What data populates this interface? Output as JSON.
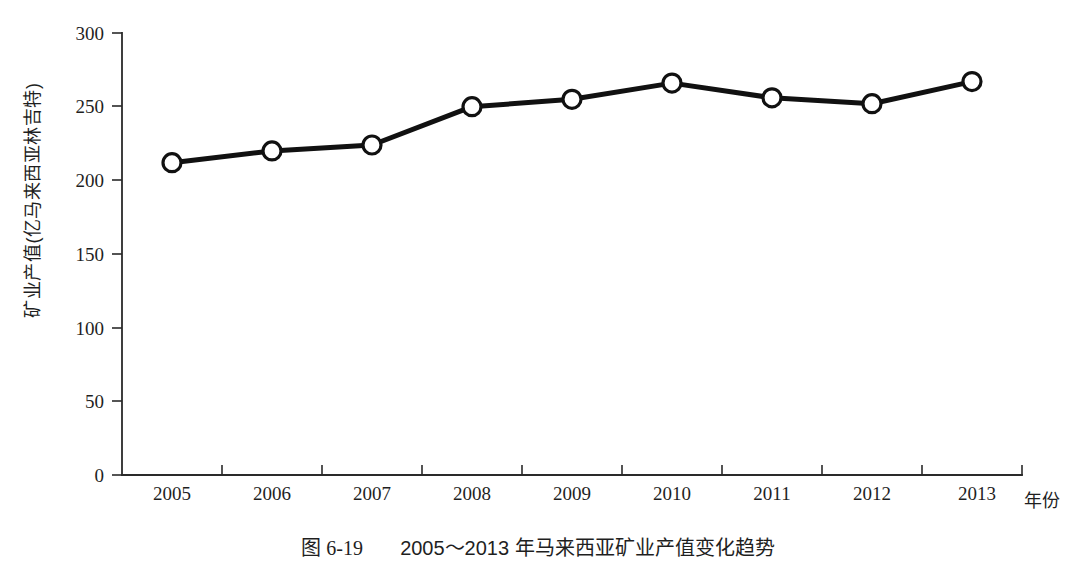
{
  "chart_data": {
    "type": "line",
    "title": "",
    "categories": [
      "2005",
      "2006",
      "2007",
      "2008",
      "2009",
      "2010",
      "2011",
      "2012",
      "2013"
    ],
    "values": [
      212,
      220,
      224,
      250,
      255,
      266,
      256,
      252,
      267
    ],
    "series": [
      {
        "name": "矿业产值",
        "values": [
          212,
          220,
          224,
          250,
          255,
          266,
          256,
          252,
          267
        ]
      }
    ],
    "xlabel": "年份",
    "ylabel": "矿业产值(亿马来西亚林吉特)",
    "ylim": [
      0,
      300
    ],
    "yticks": [
      "0",
      "50",
      "100",
      "150",
      "200",
      "250",
      "300"
    ],
    "ytick_values": [
      0,
      50,
      100,
      150,
      200,
      250,
      300
    ],
    "grid": false,
    "legend": "none",
    "marker": "open-circle",
    "line_color": "#111111",
    "marker_fill": "#ffffff",
    "marker_stroke": "#111111",
    "background": "#ffffff"
  },
  "caption": {
    "number": "图 6-19",
    "text": "2005～2013 年马来西亚矿业产值变化趋势",
    "full": "图 6-19　2005～2013 年马来西亚矿业产值变化趋势"
  }
}
